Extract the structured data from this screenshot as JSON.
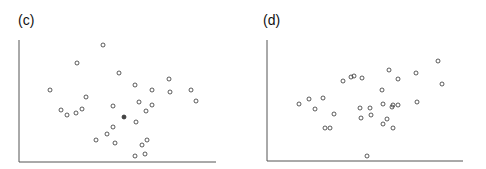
{
  "chart_data": [
    {
      "type": "scatter",
      "panel_label": "(c)",
      "title": "",
      "xlabel": "",
      "ylabel": "",
      "grid": false,
      "legend": null,
      "axes_px": {
        "x0": 19,
        "y0": 162,
        "x1": 216,
        "y1": 40
      },
      "marker": {
        "shape": "open-circle",
        "radius": 2,
        "stroke": "#333333"
      },
      "points_px": [
        [
          103,
          45
        ],
        [
          77,
          63
        ],
        [
          119,
          73
        ],
        [
          169,
          79
        ],
        [
          135,
          85
        ],
        [
          50,
          90
        ],
        [
          152,
          90
        ],
        [
          191,
          90
        ],
        [
          170,
          92
        ],
        [
          86,
          97
        ],
        [
          196,
          101
        ],
        [
          139,
          102
        ],
        [
          152,
          105
        ],
        [
          113,
          106
        ],
        [
          61,
          110
        ],
        [
          82,
          109
        ],
        [
          146,
          111
        ],
        [
          76,
          113
        ],
        [
          67,
          115
        ],
        [
          124,
          117,
          "filled"
        ],
        [
          136,
          122
        ],
        [
          113,
          127
        ],
        [
          107,
          134
        ],
        [
          96,
          140
        ],
        [
          147,
          140
        ],
        [
          115,
          143
        ],
        [
          142,
          145
        ],
        [
          145,
          154
        ],
        [
          135,
          156
        ]
      ]
    },
    {
      "type": "scatter",
      "panel_label": "(d)",
      "title": "",
      "xlabel": "",
      "ylabel": "",
      "grid": false,
      "legend": null,
      "axes_px": {
        "x0": 267,
        "y0": 161,
        "x1": 463,
        "y1": 40
      },
      "marker": {
        "shape": "open-circle",
        "radius": 2,
        "stroke": "#333333"
      },
      "points_px": [
        [
          438,
          61
        ],
        [
          389,
          70
        ],
        [
          416,
          73
        ],
        [
          351,
          77
        ],
        [
          354,
          76
        ],
        [
          362,
          78
        ],
        [
          398,
          79
        ],
        [
          343,
          81
        ],
        [
          442,
          84
        ],
        [
          382,
          90
        ],
        [
          309,
          99
        ],
        [
          323,
          98
        ],
        [
          417,
          102
        ],
        [
          299,
          104
        ],
        [
          383,
          104
        ],
        [
          393,
          105
        ],
        [
          398,
          105
        ],
        [
          392,
          107
        ],
        [
          360,
          108
        ],
        [
          370,
          108
        ],
        [
          315,
          109
        ],
        [
          334,
          114
        ],
        [
          371,
          115
        ],
        [
          361,
          118
        ],
        [
          387,
          119
        ],
        [
          383,
          124
        ],
        [
          325,
          128
        ],
        [
          330,
          128
        ],
        [
          393,
          128
        ],
        [
          367,
          156
        ]
      ]
    }
  ],
  "panels": [
    {
      "label": "(c)"
    },
    {
      "label": "(d)"
    }
  ],
  "colors": {
    "axis": "#555555",
    "marker": "#333333",
    "filled_marker": "#444444"
  }
}
